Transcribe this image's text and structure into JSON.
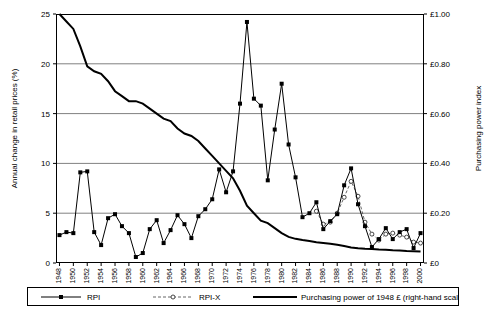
{
  "chart_data": {
    "type": "line",
    "title": "",
    "xlabel": "",
    "ylabel": "Annual change in retail prices (%)",
    "ylabel_right": "Purchasing power index",
    "x": [
      1948,
      1949,
      1950,
      1951,
      1952,
      1953,
      1954,
      1955,
      1956,
      1957,
      1958,
      1959,
      1960,
      1961,
      1962,
      1963,
      1964,
      1965,
      1966,
      1967,
      1968,
      1969,
      1970,
      1971,
      1972,
      1973,
      1974,
      1975,
      1976,
      1977,
      1978,
      1979,
      1980,
      1981,
      1982,
      1983,
      1984,
      1985,
      1986,
      1987,
      1988,
      1989,
      1990,
      1991,
      1992,
      1993,
      1994,
      1995,
      1996,
      1997,
      1998,
      1999,
      2000
    ],
    "xticklabels": [
      "1948",
      "1950",
      "1952",
      "1954",
      "1956",
      "1958",
      "1960",
      "1962",
      "1964",
      "1966",
      "1968",
      "1970",
      "1972",
      "1974",
      "1976",
      "1978",
      "1980",
      "1982",
      "1984",
      "1986",
      "1988",
      "1990",
      "1992",
      "1994",
      "1996",
      "1998",
      "2000"
    ],
    "ylim": [
      0,
      25
    ],
    "yticks": [
      0,
      5,
      10,
      15,
      20,
      25
    ],
    "yticklabels": [
      "0",
      "5",
      "10",
      "15",
      "20",
      "25"
    ],
    "ylim_right": [
      0,
      1.0
    ],
    "yticks_right": [
      0,
      0.2,
      0.4,
      0.6,
      0.8,
      1.0
    ],
    "yticklabels_right": [
      "£0",
      "£0.20",
      "£0.40",
      "£0.60",
      "£0.80",
      "£1.00"
    ],
    "grid": true,
    "legend_position": "bottom",
    "series": [
      {
        "name": "RPI",
        "axis": "left",
        "marker": "filled-square",
        "values": [
          2.8,
          3.1,
          3.0,
          9.1,
          9.2,
          3.1,
          1.8,
          4.5,
          4.9,
          3.7,
          3.0,
          0.6,
          1.0,
          3.4,
          4.3,
          2.0,
          3.3,
          4.8,
          3.9,
          2.5,
          4.7,
          5.4,
          6.4,
          9.4,
          7.1,
          9.2,
          16.0,
          24.2,
          16.5,
          15.8,
          8.3,
          13.4,
          18.0,
          11.9,
          8.6,
          4.6,
          5.0,
          6.1,
          3.4,
          4.2,
          4.9,
          7.8,
          9.5,
          5.9,
          3.7,
          1.6,
          2.4,
          3.5,
          2.4,
          3.1,
          3.4,
          1.5,
          3.0
        ]
      },
      {
        "name": "RPI-X",
        "axis": "left",
        "marker": "open-circle",
        "values": [
          null,
          null,
          null,
          null,
          null,
          null,
          null,
          null,
          null,
          null,
          null,
          null,
          null,
          null,
          null,
          null,
          null,
          null,
          null,
          null,
          null,
          null,
          null,
          null,
          null,
          null,
          null,
          null,
          null,
          null,
          null,
          null,
          null,
          null,
          null,
          null,
          null,
          5.2,
          3.9,
          4.1,
          5.0,
          6.6,
          8.2,
          6.7,
          4.1,
          2.9,
          2.3,
          2.9,
          3.0,
          2.8,
          2.6,
          2.1,
          2.0
        ]
      },
      {
        "name": "Purchasing power of 1948 £ (right-hand scale)",
        "axis": "right",
        "marker": "none",
        "values": [
          1.0,
          0.97,
          0.94,
          0.87,
          0.79,
          0.77,
          0.76,
          0.73,
          0.69,
          0.67,
          0.65,
          0.65,
          0.64,
          0.62,
          0.6,
          0.58,
          0.57,
          0.54,
          0.52,
          0.51,
          0.49,
          0.46,
          0.43,
          0.4,
          0.37,
          0.34,
          0.29,
          0.23,
          0.2,
          0.17,
          0.16,
          0.14,
          0.12,
          0.105,
          0.097,
          0.092,
          0.088,
          0.083,
          0.08,
          0.077,
          0.073,
          0.068,
          0.062,
          0.059,
          0.057,
          0.056,
          0.054,
          0.053,
          0.051,
          0.05,
          0.048,
          0.047,
          0.046
        ]
      }
    ]
  },
  "legend": {
    "items": [
      {
        "label": "RPI",
        "marker": "filled-square"
      },
      {
        "label": "RPI-X",
        "marker": "open-circle"
      },
      {
        "label": "Purchasing power of 1948 £ (right-hand scale)",
        "marker": "line"
      }
    ]
  }
}
